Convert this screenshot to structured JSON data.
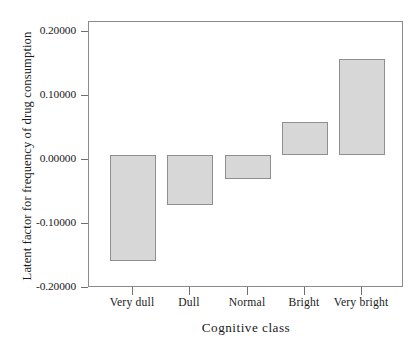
{
  "chart_data": {
    "type": "bar",
    "title": "",
    "xlabel": "Cognitive class",
    "ylabel": "Latent factor for frequency of drug consumption",
    "categories": [
      "Very dull",
      "Dull",
      "Normal",
      "Bright",
      "Very bright"
    ],
    "values": [
      -0.161,
      -0.075,
      -0.036,
      0.05,
      0.145
    ],
    "ylim": [
      -0.2,
      0.2
    ],
    "yticks": [
      0.2,
      0.1,
      0.0,
      -0.1,
      -0.2
    ],
    "ytick_labels": [
      "0.20000",
      "0.10000",
      "0.00000",
      "-0.10000",
      "-0.20000"
    ],
    "grid": false,
    "legend": "none",
    "bar_fill_color": "#d7d7d7",
    "bar_border_color": "#8f8f8f",
    "axis_color": "#8a8a8a",
    "background_color": "#ffffff"
  }
}
